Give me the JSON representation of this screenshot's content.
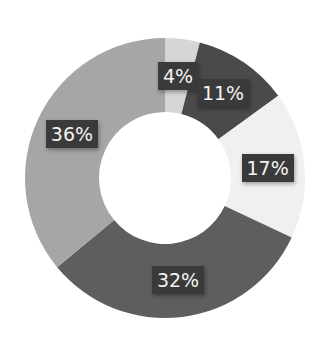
{
  "chart_data": {
    "type": "pie",
    "variant": "donut",
    "title": "",
    "start_angle_deg": 0,
    "direction": "clockwise",
    "categories": [
      "",
      "",
      "",
      "",
      ""
    ],
    "values": [
      4,
      11,
      17,
      32,
      36
    ],
    "labels": [
      "4%",
      "11%",
      "17%",
      "32%",
      "36%"
    ],
    "colors": [
      "#d6d6d6",
      "#4a4a4a",
      "#f0f0f0",
      "#5e5e5e",
      "#a6a6a6"
    ],
    "legend": "none"
  },
  "layout": {
    "cx": 165,
    "cy": 178,
    "outer_r": 140,
    "inner_r": 66
  }
}
